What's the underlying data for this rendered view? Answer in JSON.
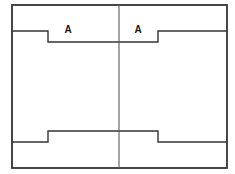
{
  "drawing": {
    "title": "Stepped Rectangular Plan View",
    "type": "technical-line-drawing",
    "canvas": {
      "width": 235,
      "height": 174
    },
    "style": {
      "background_color": "#ffffff",
      "line_color": "#333333",
      "outer_line_width": 1.8,
      "inner_line_width": 1.4,
      "center_line_width": 1.1,
      "label_color": "#1a1a1a"
    },
    "geometry": {
      "outer_rect": {
        "x": 12,
        "y": 5,
        "width": 215,
        "height": 163
      },
      "left_edge_x": 12,
      "right_edge_x": 227,
      "top_edge_y": 5,
      "bottom_edge_y": 168,
      "upper_high_y": 31,
      "upper_low_y": 42,
      "lower_high_y": 131,
      "lower_low_y": 142,
      "left_step_x": 48,
      "right_step_x": 158,
      "center_line_x": 119
    },
    "paths": {
      "upper_profile": "M 12 31 L 48 31 L 48 42 L 158 42 L 158 31 L 227 31",
      "lower_profile": "M 12 142 L 48 142 L 48 131 L 158 131 L 158 142 L 227 142",
      "center_vertical": "M 119 5 L 119 168"
    },
    "labels": [
      {
        "id": "section-marker-left",
        "text": "A",
        "x": 68,
        "y": 30
      },
      {
        "id": "section-marker-right",
        "text": "A",
        "x": 138,
        "y": 30
      }
    ]
  }
}
